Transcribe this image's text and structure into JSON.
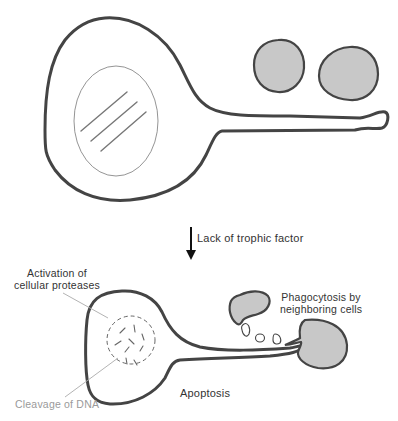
{
  "diagram": {
    "type": "biology-process",
    "colors": {
      "outline": "#444444",
      "target_cell_fill": "#c8c8c8",
      "nucleus_line": "#777777",
      "leader_line": "#aaaaaa",
      "label_text": "#333333",
      "label_gray_text": "#9a9a9a"
    },
    "top_panel": {
      "neuron": "healthy neuron with nucleus and axon",
      "target_cells_count": 2
    },
    "arrow": {
      "label": "Lack of trophic factor",
      "direction": "down"
    },
    "bottom_panel": {
      "labels": {
        "proteases": "Activation of\ncellular proteases",
        "phagocytosis": "Phagocytosis by\nneighboring cells",
        "apoptosis": "Apoptosis",
        "dna": "Cleavage of DNA"
      },
      "fragments_count": 3,
      "phagocyte_count": 2
    }
  }
}
